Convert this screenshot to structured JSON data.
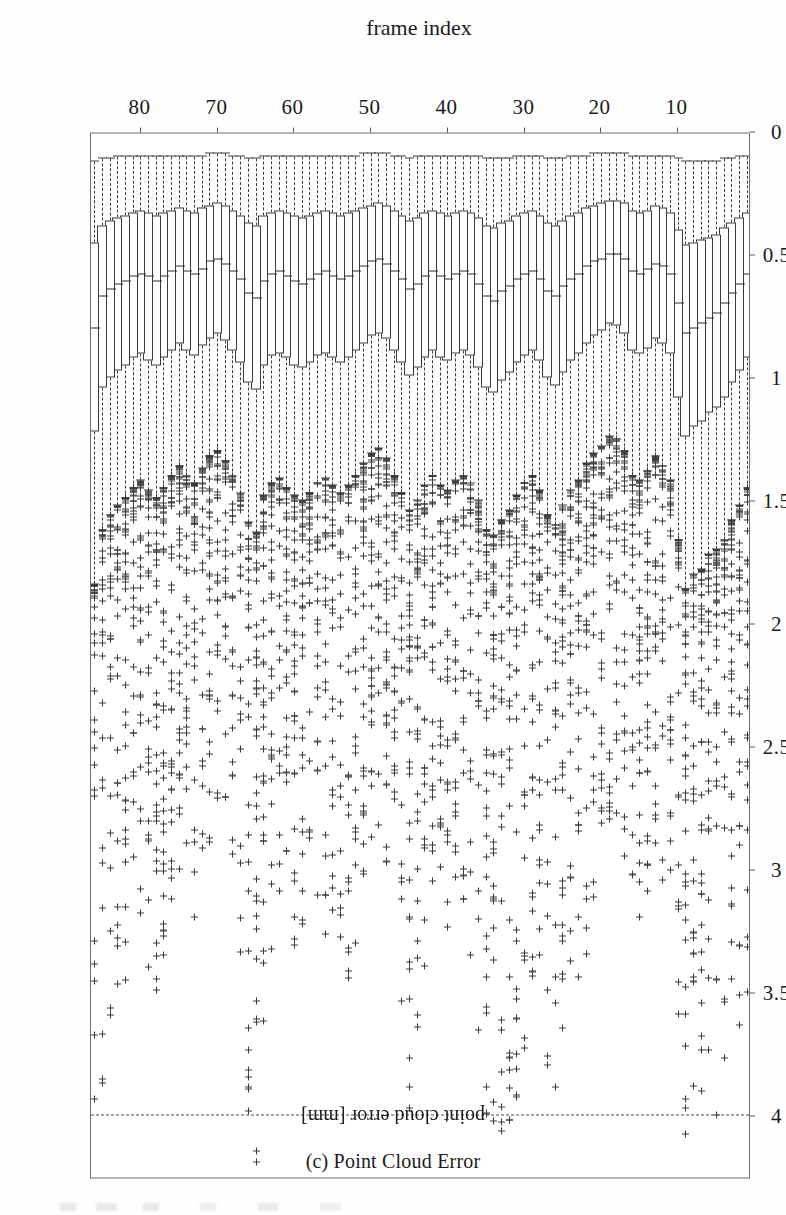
{
  "figure": {
    "caption": "(c) Point Cloud Error",
    "value_axis_title": "point cloud error [mm]",
    "category_axis_title": "frame index"
  },
  "chart_data": {
    "type": "box",
    "orientation": "horizontal-rotated",
    "title": "(c) Point Cloud Error",
    "xlabel": "frame index",
    "ylabel": "point cloud error [mm]",
    "ylim": [
      0,
      4.25
    ],
    "xlim": [
      0.5,
      86.5
    ],
    "grid": false,
    "legend": null,
    "value_ticks": [
      0,
      0.5,
      1,
      1.5,
      2,
      2.5,
      3,
      3.5,
      4
    ],
    "value_tick_labels": [
      "0",
      "0.5",
      "1",
      "1.5",
      "2",
      "2.5",
      "3",
      "3.5",
      "4"
    ],
    "category_ticks": [
      10,
      20,
      30,
      40,
      50,
      60,
      70,
      80
    ],
    "category_tick_labels": [
      "10",
      "20",
      "30",
      "40",
      "50",
      "60",
      "70",
      "80"
    ],
    "reference_line": {
      "value": 4.0,
      "style": "dashed",
      "label": ""
    },
    "n_boxes": 86,
    "outlier_marker": "+",
    "boxes": [
      {
        "frame": 1,
        "whisker_low": 0.1,
        "q1": 0.33,
        "median": 0.58,
        "q3": 0.92,
        "whisker_high": 1.45,
        "outlier_max": 3.55
      },
      {
        "frame": 2,
        "whisker_low": 0.1,
        "q1": 0.35,
        "median": 0.62,
        "q3": 0.97,
        "whisker_high": 1.52,
        "outlier_max": 3.8
      },
      {
        "frame": 3,
        "whisker_low": 0.11,
        "q1": 0.37,
        "median": 0.66,
        "q3": 1.02,
        "whisker_high": 1.58,
        "outlier_max": 4.05
      },
      {
        "frame": 4,
        "whisker_low": 0.11,
        "q1": 0.39,
        "median": 0.7,
        "q3": 1.08,
        "whisker_high": 1.66,
        "outlier_max": 4.1
      },
      {
        "frame": 5,
        "whisker_low": 0.12,
        "q1": 0.42,
        "median": 0.74,
        "q3": 1.12,
        "whisker_high": 1.7,
        "outlier_max": 4.05
      },
      {
        "frame": 6,
        "whisker_low": 0.12,
        "q1": 0.43,
        "median": 0.76,
        "q3": 1.14,
        "whisker_high": 1.72,
        "outlier_max": 3.95
      },
      {
        "frame": 7,
        "whisker_low": 0.12,
        "q1": 0.44,
        "median": 0.78,
        "q3": 1.18,
        "whisker_high": 1.78,
        "outlier_max": 4.12
      },
      {
        "frame": 8,
        "whisker_low": 0.12,
        "q1": 0.45,
        "median": 0.8,
        "q3": 1.2,
        "whisker_high": 1.8,
        "outlier_max": 4.15
      },
      {
        "frame": 9,
        "whisker_low": 0.12,
        "q1": 0.46,
        "median": 0.82,
        "q3": 1.24,
        "whisker_high": 1.86,
        "outlier_max": 4.1
      },
      {
        "frame": 10,
        "whisker_low": 0.11,
        "q1": 0.4,
        "median": 0.7,
        "q3": 1.08,
        "whisker_high": 1.66,
        "outlier_max": 3.6
      },
      {
        "frame": 11,
        "whisker_low": 0.1,
        "q1": 0.33,
        "median": 0.58,
        "q3": 0.9,
        "whisker_high": 1.42,
        "outlier_max": 3.25
      },
      {
        "frame": 12,
        "whisker_low": 0.1,
        "q1": 0.31,
        "median": 0.55,
        "q3": 0.86,
        "whisker_high": 1.36,
        "outlier_max": 3.1
      },
      {
        "frame": 13,
        "whisker_low": 0.1,
        "q1": 0.3,
        "median": 0.54,
        "q3": 0.84,
        "whisker_high": 1.32,
        "outlier_max": 3.0
      },
      {
        "frame": 14,
        "whisker_low": 0.1,
        "q1": 0.32,
        "median": 0.56,
        "q3": 0.88,
        "whisker_high": 1.38,
        "outlier_max": 3.3
      },
      {
        "frame": 15,
        "whisker_low": 0.1,
        "q1": 0.33,
        "median": 0.58,
        "q3": 0.9,
        "whisker_high": 1.42,
        "outlier_max": 3.4
      },
      {
        "frame": 16,
        "whisker_low": 0.1,
        "q1": 0.32,
        "median": 0.57,
        "q3": 0.89,
        "whisker_high": 1.4,
        "outlier_max": 3.15
      },
      {
        "frame": 17,
        "whisker_low": 0.09,
        "q1": 0.29,
        "median": 0.52,
        "q3": 0.82,
        "whisker_high": 1.3,
        "outlier_max": 2.95
      },
      {
        "frame": 18,
        "whisker_low": 0.09,
        "q1": 0.28,
        "median": 0.5,
        "q3": 0.79,
        "whisker_high": 1.25,
        "outlier_max": 2.8
      },
      {
        "frame": 19,
        "whisker_low": 0.09,
        "q1": 0.28,
        "median": 0.5,
        "q3": 0.78,
        "whisker_high": 1.24,
        "outlier_max": 2.85
      },
      {
        "frame": 20,
        "whisker_low": 0.09,
        "q1": 0.29,
        "median": 0.52,
        "q3": 0.81,
        "whisker_high": 1.28,
        "outlier_max": 3.05
      },
      {
        "frame": 21,
        "whisker_low": 0.09,
        "q1": 0.3,
        "median": 0.53,
        "q3": 0.83,
        "whisker_high": 1.31,
        "outlier_max": 3.2
      },
      {
        "frame": 22,
        "whisker_low": 0.1,
        "q1": 0.31,
        "median": 0.55,
        "q3": 0.86,
        "whisker_high": 1.35,
        "outlier_max": 3.35
      },
      {
        "frame": 23,
        "whisker_low": 0.1,
        "q1": 0.33,
        "median": 0.58,
        "q3": 0.9,
        "whisker_high": 1.42,
        "outlier_max": 3.45
      },
      {
        "frame": 24,
        "whisker_low": 0.1,
        "q1": 0.34,
        "median": 0.6,
        "q3": 0.93,
        "whisker_high": 1.46,
        "outlier_max": 3.55
      },
      {
        "frame": 25,
        "whisker_low": 0.11,
        "q1": 0.36,
        "median": 0.63,
        "q3": 0.98,
        "whisker_high": 1.52,
        "outlier_max": 3.7
      },
      {
        "frame": 26,
        "whisker_low": 0.11,
        "q1": 0.38,
        "median": 0.67,
        "q3": 1.03,
        "whisker_high": 1.6,
        "outlier_max": 3.95
      },
      {
        "frame": 27,
        "whisker_low": 0.11,
        "q1": 0.37,
        "median": 0.65,
        "q3": 1.0,
        "whisker_high": 1.56,
        "outlier_max": 3.85
      },
      {
        "frame": 28,
        "whisker_low": 0.1,
        "q1": 0.34,
        "median": 0.6,
        "q3": 0.93,
        "whisker_high": 1.46,
        "outlier_max": 3.6
      },
      {
        "frame": 29,
        "whisker_low": 0.1,
        "q1": 0.32,
        "median": 0.57,
        "q3": 0.89,
        "whisker_high": 1.4,
        "outlier_max": 3.5
      },
      {
        "frame": 30,
        "whisker_low": 0.1,
        "q1": 0.33,
        "median": 0.58,
        "q3": 0.91,
        "whisker_high": 1.43,
        "outlier_max": 3.75
      },
      {
        "frame": 31,
        "whisker_low": 0.1,
        "q1": 0.34,
        "median": 0.6,
        "q3": 0.94,
        "whisker_high": 1.48,
        "outlier_max": 4.0
      },
      {
        "frame": 32,
        "whisker_low": 0.11,
        "q1": 0.36,
        "median": 0.63,
        "q3": 0.98,
        "whisker_high": 1.54,
        "outlier_max": 4.05
      },
      {
        "frame": 33,
        "whisker_low": 0.11,
        "q1": 0.37,
        "median": 0.65,
        "q3": 1.01,
        "whisker_high": 1.58,
        "outlier_max": 4.1
      },
      {
        "frame": 34,
        "whisker_low": 0.11,
        "q1": 0.39,
        "median": 0.69,
        "q3": 1.06,
        "whisker_high": 1.64,
        "outlier_max": 4.15
      },
      {
        "frame": 35,
        "whisker_low": 0.11,
        "q1": 0.38,
        "median": 0.67,
        "q3": 1.04,
        "whisker_high": 1.62,
        "outlier_max": 4.05
      },
      {
        "frame": 36,
        "whisker_low": 0.1,
        "q1": 0.35,
        "median": 0.62,
        "q3": 0.96,
        "whisker_high": 1.5,
        "outlier_max": 3.7
      },
      {
        "frame": 37,
        "whisker_low": 0.1,
        "q1": 0.33,
        "median": 0.58,
        "q3": 0.91,
        "whisker_high": 1.43,
        "outlier_max": 3.4
      },
      {
        "frame": 38,
        "whisker_low": 0.1,
        "q1": 0.32,
        "median": 0.57,
        "q3": 0.89,
        "whisker_high": 1.4,
        "outlier_max": 3.2
      },
      {
        "frame": 39,
        "whisker_low": 0.1,
        "q1": 0.33,
        "median": 0.58,
        "q3": 0.9,
        "whisker_high": 1.42,
        "outlier_max": 3.1
      },
      {
        "frame": 40,
        "whisker_low": 0.1,
        "q1": 0.34,
        "median": 0.6,
        "q3": 0.93,
        "whisker_high": 1.46,
        "outlier_max": 3.25
      },
      {
        "frame": 41,
        "whisker_low": 0.1,
        "q1": 0.33,
        "median": 0.59,
        "q3": 0.92,
        "whisker_high": 1.44,
        "outlier_max": 3.15
      },
      {
        "frame": 42,
        "whisker_low": 0.1,
        "q1": 0.32,
        "median": 0.57,
        "q3": 0.89,
        "whisker_high": 1.4,
        "outlier_max": 3.3
      },
      {
        "frame": 43,
        "whisker_low": 0.1,
        "q1": 0.33,
        "median": 0.59,
        "q3": 0.92,
        "whisker_high": 1.44,
        "outlier_max": 3.55
      },
      {
        "frame": 44,
        "whisker_low": 0.1,
        "q1": 0.35,
        "median": 0.62,
        "q3": 0.96,
        "whisker_high": 1.5,
        "outlier_max": 3.85
      },
      {
        "frame": 45,
        "whisker_low": 0.11,
        "q1": 0.36,
        "median": 0.64,
        "q3": 0.99,
        "whisker_high": 1.54,
        "outlier_max": 4.05
      },
      {
        "frame": 46,
        "whisker_low": 0.1,
        "q1": 0.34,
        "median": 0.6,
        "q3": 0.94,
        "whisker_high": 1.47,
        "outlier_max": 3.6
      },
      {
        "frame": 47,
        "whisker_low": 0.1,
        "q1": 0.32,
        "median": 0.57,
        "q3": 0.89,
        "whisker_high": 1.4,
        "outlier_max": 3.25
      },
      {
        "frame": 48,
        "whisker_low": 0.09,
        "q1": 0.3,
        "median": 0.54,
        "q3": 0.84,
        "whisker_high": 1.33,
        "outlier_max": 3.0
      },
      {
        "frame": 49,
        "whisker_low": 0.09,
        "q1": 0.29,
        "median": 0.52,
        "q3": 0.82,
        "whisker_high": 1.29,
        "outlier_max": 2.85
      },
      {
        "frame": 50,
        "whisker_low": 0.09,
        "q1": 0.3,
        "median": 0.53,
        "q3": 0.83,
        "whisker_high": 1.31,
        "outlier_max": 2.9
      },
      {
        "frame": 51,
        "whisker_low": 0.09,
        "q1": 0.31,
        "median": 0.55,
        "q3": 0.86,
        "whisker_high": 1.35,
        "outlier_max": 3.05
      },
      {
        "frame": 52,
        "whisker_low": 0.1,
        "q1": 0.32,
        "median": 0.57,
        "q3": 0.89,
        "whisker_high": 1.4,
        "outlier_max": 3.3
      },
      {
        "frame": 53,
        "whisker_low": 0.1,
        "q1": 0.33,
        "median": 0.59,
        "q3": 0.92,
        "whisker_high": 1.44,
        "outlier_max": 3.5
      },
      {
        "frame": 54,
        "whisker_low": 0.1,
        "q1": 0.34,
        "median": 0.6,
        "q3": 0.94,
        "whisker_high": 1.47,
        "outlier_max": 3.55
      },
      {
        "frame": 55,
        "whisker_low": 0.1,
        "q1": 0.33,
        "median": 0.59,
        "q3": 0.92,
        "whisker_high": 1.44,
        "outlier_max": 3.45
      },
      {
        "frame": 56,
        "whisker_low": 0.1,
        "q1": 0.32,
        "median": 0.57,
        "q3": 0.9,
        "whisker_high": 1.41,
        "outlier_max": 3.3
      },
      {
        "frame": 57,
        "whisker_low": 0.1,
        "q1": 0.33,
        "median": 0.58,
        "q3": 0.91,
        "whisker_high": 1.43,
        "outlier_max": 3.2
      },
      {
        "frame": 58,
        "whisker_low": 0.1,
        "q1": 0.34,
        "median": 0.6,
        "q3": 0.94,
        "whisker_high": 1.47,
        "outlier_max": 3.15
      },
      {
        "frame": 59,
        "whisker_low": 0.1,
        "q1": 0.35,
        "median": 0.62,
        "q3": 0.96,
        "whisker_high": 1.5,
        "outlier_max": 3.25
      },
      {
        "frame": 60,
        "whisker_low": 0.1,
        "q1": 0.34,
        "median": 0.61,
        "q3": 0.95,
        "whisker_high": 1.48,
        "outlier_max": 3.35
      },
      {
        "frame": 61,
        "whisker_low": 0.1,
        "q1": 0.33,
        "median": 0.59,
        "q3": 0.92,
        "whisker_high": 1.45,
        "outlier_max": 3.2
      },
      {
        "frame": 62,
        "whisker_low": 0.1,
        "q1": 0.32,
        "median": 0.57,
        "q3": 0.9,
        "whisker_high": 1.41,
        "outlier_max": 3.1
      },
      {
        "frame": 63,
        "whisker_low": 0.1,
        "q1": 0.33,
        "median": 0.58,
        "q3": 0.91,
        "whisker_high": 1.43,
        "outlier_max": 3.35
      },
      {
        "frame": 64,
        "whisker_low": 0.1,
        "q1": 0.34,
        "median": 0.61,
        "q3": 0.95,
        "whisker_high": 1.48,
        "outlier_max": 3.7
      },
      {
        "frame": 65,
        "whisker_low": 0.11,
        "q1": 0.38,
        "median": 0.68,
        "q3": 1.05,
        "whisker_high": 1.63,
        "outlier_max": 4.2
      },
      {
        "frame": 66,
        "whisker_low": 0.11,
        "q1": 0.37,
        "median": 0.66,
        "q3": 1.02,
        "whisker_high": 1.59,
        "outlier_max": 4.18
      },
      {
        "frame": 67,
        "whisker_low": 0.1,
        "q1": 0.34,
        "median": 0.6,
        "q3": 0.94,
        "whisker_high": 1.47,
        "outlier_max": 3.4
      },
      {
        "frame": 68,
        "whisker_low": 0.1,
        "q1": 0.32,
        "median": 0.57,
        "q3": 0.89,
        "whisker_high": 1.4,
        "outlier_max": 3.0
      },
      {
        "frame": 69,
        "whisker_low": 0.09,
        "q1": 0.3,
        "median": 0.54,
        "q3": 0.85,
        "whisker_high": 1.34,
        "outlier_max": 2.8
      },
      {
        "frame": 70,
        "whisker_low": 0.09,
        "q1": 0.29,
        "median": 0.52,
        "q3": 0.82,
        "whisker_high": 1.3,
        "outlier_max": 2.75
      },
      {
        "frame": 71,
        "whisker_low": 0.09,
        "q1": 0.3,
        "median": 0.53,
        "q3": 0.84,
        "whisker_high": 1.32,
        "outlier_max": 2.9
      },
      {
        "frame": 72,
        "whisker_low": 0.1,
        "q1": 0.31,
        "median": 0.56,
        "q3": 0.87,
        "whisker_high": 1.37,
        "outlier_max": 3.05
      },
      {
        "frame": 73,
        "whisker_low": 0.1,
        "q1": 0.33,
        "median": 0.58,
        "q3": 0.91,
        "whisker_high": 1.43,
        "outlier_max": 3.2
      },
      {
        "frame": 74,
        "whisker_low": 0.1,
        "q1": 0.32,
        "median": 0.57,
        "q3": 0.89,
        "whisker_high": 1.4,
        "outlier_max": 3.1
      },
      {
        "frame": 75,
        "whisker_low": 0.1,
        "q1": 0.31,
        "median": 0.55,
        "q3": 0.86,
        "whisker_high": 1.36,
        "outlier_max": 3.0
      },
      {
        "frame": 76,
        "whisker_low": 0.1,
        "q1": 0.32,
        "median": 0.57,
        "q3": 0.89,
        "whisker_high": 1.4,
        "outlier_max": 3.15
      },
      {
        "frame": 77,
        "whisker_low": 0.1,
        "q1": 0.33,
        "median": 0.59,
        "q3": 0.92,
        "whisker_high": 1.45,
        "outlier_max": 3.35
      },
      {
        "frame": 78,
        "whisker_low": 0.1,
        "q1": 0.34,
        "median": 0.61,
        "q3": 0.95,
        "whisker_high": 1.49,
        "outlier_max": 3.55
      },
      {
        "frame": 79,
        "whisker_low": 0.1,
        "q1": 0.33,
        "median": 0.59,
        "q3": 0.93,
        "whisker_high": 1.46,
        "outlier_max": 3.4
      },
      {
        "frame": 80,
        "whisker_low": 0.1,
        "q1": 0.32,
        "median": 0.58,
        "q3": 0.9,
        "whisker_high": 1.42,
        "outlier_max": 3.25
      },
      {
        "frame": 81,
        "whisker_low": 0.1,
        "q1": 0.33,
        "median": 0.59,
        "q3": 0.92,
        "whisker_high": 1.45,
        "outlier_max": 3.3
      },
      {
        "frame": 82,
        "whisker_low": 0.1,
        "q1": 0.34,
        "median": 0.61,
        "q3": 0.95,
        "whisker_high": 1.49,
        "outlier_max": 3.45
      },
      {
        "frame": 83,
        "whisker_low": 0.1,
        "q1": 0.35,
        "median": 0.62,
        "q3": 0.97,
        "whisker_high": 1.52,
        "outlier_max": 3.55
      },
      {
        "frame": 84,
        "whisker_low": 0.11,
        "q1": 0.36,
        "median": 0.64,
        "q3": 1.0,
        "whisker_high": 1.56,
        "outlier_max": 3.7
      },
      {
        "frame": 85,
        "whisker_low": 0.11,
        "q1": 0.38,
        "median": 0.67,
        "q3": 1.04,
        "whisker_high": 1.62,
        "outlier_max": 3.95
      },
      {
        "frame": 86,
        "whisker_low": 0.12,
        "q1": 0.45,
        "median": 0.8,
        "q3": 1.22,
        "whisker_high": 1.84,
        "outlier_max": 4.12
      }
    ]
  }
}
